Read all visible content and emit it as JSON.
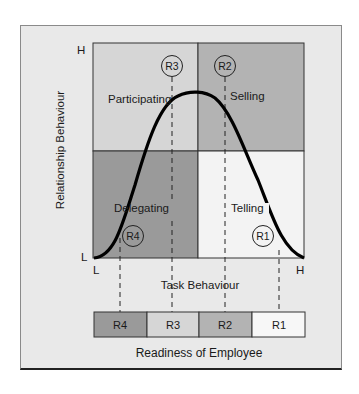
{
  "diagram": {
    "y_axis": {
      "label": "Relationship Behaviour",
      "high": "H",
      "low": "L"
    },
    "x_axis": {
      "label": "Task Behaviour",
      "low": "L",
      "high": "H"
    },
    "quadrants": [
      {
        "id": "S3",
        "label": "Participating",
        "readiness": "R3",
        "position": "top-left",
        "color": "#d6d6d6"
      },
      {
        "id": "S2",
        "label": "Selling",
        "readiness": "R2",
        "position": "top-right",
        "color": "#b3b3b3"
      },
      {
        "id": "S4",
        "label": "Delegating",
        "readiness": "R4",
        "position": "bottom-left",
        "color": "#9a9a9a"
      },
      {
        "id": "S1",
        "label": "Telling",
        "readiness": "R1",
        "position": "bottom-right",
        "color": "#f3f3f3"
      }
    ],
    "curve": "bell-shaped leadership curve from low-low (L,L) peaking near top center and descending to high task/low relationship (H,L)",
    "readiness_bar": {
      "label": "Readiness of Employee",
      "segments": [
        {
          "label": "R4",
          "color": "#9a9a9a"
        },
        {
          "label": "R3",
          "color": "#d6d6d6"
        },
        {
          "label": "R2",
          "color": "#b3b3b3"
        },
        {
          "label": "R1",
          "color": "#f7f7f7"
        }
      ]
    }
  }
}
